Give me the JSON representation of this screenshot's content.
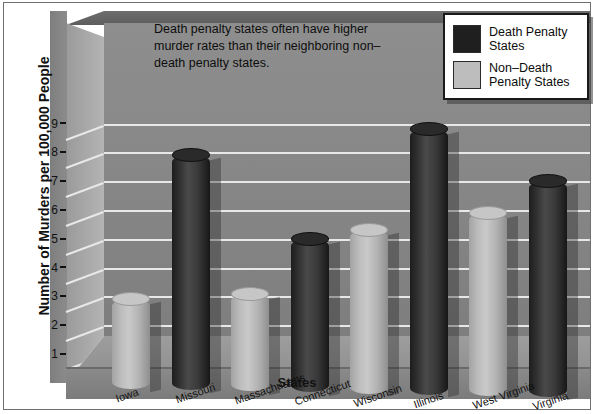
{
  "chart_data": {
    "type": "bar",
    "title": "",
    "annotation": "Death penalty states often have higher murder rates than their neighboring non–death penalty states.",
    "xlabel": "States",
    "ylabel": "Number of Murders per 100,000 People",
    "ylim": [
      0,
      10
    ],
    "ytick_labels": [
      "1",
      "2",
      "3",
      "4",
      "5",
      "6",
      "7",
      "8",
      "9"
    ],
    "ytick_values": [
      1,
      2,
      3,
      4,
      5,
      6,
      7,
      8,
      9
    ],
    "grid": true,
    "legend_position": "top-right",
    "categories": [
      "Iowa",
      "Missouri",
      "Massachusetts",
      "Connecticut",
      "Wisconsin",
      "Illinois",
      "West Virginia",
      "Virginia"
    ],
    "values": [
      2.9,
      7.9,
      3.1,
      5.0,
      5.3,
      8.8,
      5.9,
      7.0
    ],
    "point_groups": [
      "Non-Death Penalty States",
      "Death Penalty States",
      "Non-Death Penalty States",
      "Death Penalty States",
      "Non-Death Penalty States",
      "Death Penalty States",
      "Non-Death Penalty States",
      "Death Penalty States"
    ],
    "series": [
      {
        "name": "Death Penalty States",
        "color": "#1f1f1f",
        "points": [
          {
            "category": "Missouri",
            "value": 7.9
          },
          {
            "category": "Connecticut",
            "value": 5.0
          },
          {
            "category": "Illinois",
            "value": 8.8
          },
          {
            "category": "Virginia",
            "value": 7.0
          }
        ]
      },
      {
        "name": "Non-Death Penalty States",
        "color": "#bdbdbd",
        "points": [
          {
            "category": "Iowa",
            "value": 2.9
          },
          {
            "category": "Massachusetts",
            "value": 3.1
          },
          {
            "category": "Wisconsin",
            "value": 5.3
          },
          {
            "category": "West Virginia",
            "value": 5.9
          }
        ]
      }
    ]
  },
  "legend": {
    "items": [
      {
        "label": "Death Penalty States",
        "color": "#1f1f1f"
      },
      {
        "label": "Non–Death Penalty States",
        "color": "#bdbdbd"
      }
    ]
  }
}
